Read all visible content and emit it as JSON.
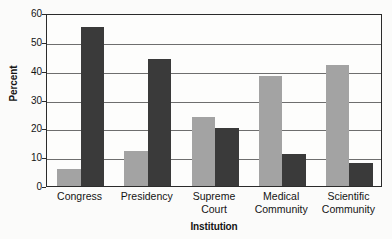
{
  "chart_data": {
    "type": "bar",
    "title": "",
    "subtitle": "",
    "xlabel": "Institution",
    "ylabel": "Percent",
    "ylim": [
      0,
      60
    ],
    "yticks": [
      0,
      10,
      20,
      30,
      40,
      50,
      60
    ],
    "ytick_labels": [
      "0",
      "10",
      "20",
      "30",
      "40",
      "50",
      "60"
    ],
    "grid": true,
    "grid_axis": "y",
    "legend": false,
    "legend_position": "none",
    "orientation": "vertical",
    "grouping": "grouped",
    "categories": [
      "Congress",
      "Presidency",
      "Supreme Court",
      "Medical Community",
      "Scientific Community"
    ],
    "category_label_lines": [
      [
        "Congress"
      ],
      [
        "Presidency"
      ],
      [
        "Supreme",
        "Court"
      ],
      [
        "Medical",
        "Community"
      ],
      [
        "Scientific",
        "Community"
      ]
    ],
    "series": [
      {
        "name": "series-1",
        "color": "#a3a3a3",
        "values": [
          6,
          12,
          24,
          38,
          42
        ]
      },
      {
        "name": "series-2",
        "color": "#3a3a3a",
        "values": [
          55,
          44,
          20,
          11,
          8
        ]
      }
    ],
    "annotations": []
  },
  "style": {
    "background": "#fbfbfa",
    "plot_background": "#fdfdfc",
    "axis_color": "#2b2b2b",
    "grid_color": "#6e6e6e",
    "text_color": "#141414"
  }
}
